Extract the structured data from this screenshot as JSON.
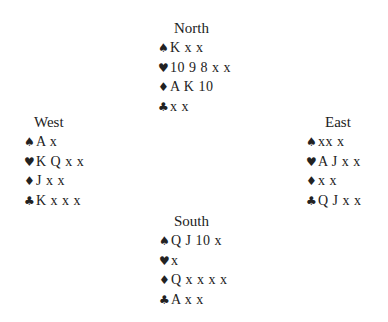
{
  "suits": {
    "spades": "♠",
    "hearts": "♥",
    "diamonds": "♦",
    "clubs": "♣"
  },
  "hands": {
    "north": {
      "title": "North",
      "spades": "K x x",
      "hearts": "10 9 8 x x",
      "diamonds": "A K 10",
      "clubs": "x x"
    },
    "west": {
      "title": "West",
      "spades": "A x",
      "hearts": "K Q x x",
      "diamonds": "J x x",
      "clubs": "K x x x"
    },
    "east": {
      "title": "East",
      "spades": "xx x",
      "hearts": "A J x x",
      "diamonds": "x x",
      "clubs": "Q J x x"
    },
    "south": {
      "title": "South",
      "spades": "Q J 10 x",
      "hearts": "x",
      "diamonds": "Q x x x x",
      "clubs": "A x x"
    }
  }
}
